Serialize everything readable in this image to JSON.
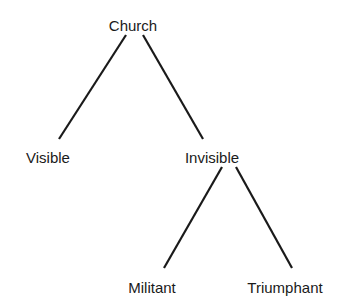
{
  "diagram": {
    "type": "tree",
    "root": {
      "label": "Church",
      "children": [
        {
          "label": "Visible",
          "children": []
        },
        {
          "label": "Invisible",
          "children": [
            {
              "label": "Militant",
              "children": []
            },
            {
              "label": "Triumphant",
              "children": []
            }
          ]
        }
      ]
    },
    "nodes": {
      "church": "Church",
      "visible": "Visible",
      "invisible": "Invisible",
      "militant": "Militant",
      "triumphant": "Triumphant"
    },
    "edges": [
      {
        "from": "Church",
        "to": "Visible"
      },
      {
        "from": "Church",
        "to": "Invisible"
      },
      {
        "from": "Invisible",
        "to": "Militant"
      },
      {
        "from": "Invisible",
        "to": "Triumphant"
      }
    ],
    "colors": {
      "line": "#1a1a1a",
      "text": "#1a1a1a",
      "background": "#ffffff"
    }
  }
}
